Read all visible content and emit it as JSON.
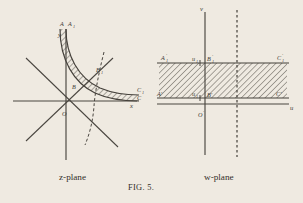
{
  "figure": {
    "number": "FIG. 5.",
    "caption_left": "z-plane",
    "caption_right": "w-plane",
    "background_color": "#efeae1",
    "ink_color": "#45413b"
  },
  "z_plane": {
    "name": "z-plane",
    "axis_x_label": "x",
    "axis_y_label": "y",
    "origin_label": "O",
    "points": {
      "A": "A",
      "A1": "A",
      "A1_sub": "1",
      "B": "B",
      "B1": "B",
      "B1_sub": "1",
      "C": "C",
      "C1": "C",
      "C1_sub": "1"
    },
    "features": [
      "x-axis",
      "y-axis",
      "asymptote-diagonal-positive",
      "asymptote-diagonal-negative",
      "hyperbola-branch-inner",
      "hyperbola-branch-outer",
      "hyperbola-branch-dashed",
      "hatched-region"
    ]
  },
  "w_plane": {
    "name": "w-plane",
    "axis_u_label": "u",
    "axis_v_label": "v",
    "origin_label": "O",
    "origin_prime": "′",
    "tick_u1_lower": "u",
    "tick_u1_lower_sub": "1",
    "tick_u1_upper": "u",
    "tick_u1_upper_sub": "1",
    "points": {
      "A_prime": "A′",
      "A1_prime": "A",
      "A1_prime_sub": "1",
      "A1_prime_mark": "′",
      "B_prime": "B′",
      "B1_prime": "B",
      "B1_prime_sub": "1",
      "B1_prime_mark": "′",
      "C_prime": "C′",
      "C1_prime": "C",
      "C1_prime_sub": "1",
      "C1_prime_mark": "′"
    },
    "features": [
      "u-axis",
      "v-axis",
      "hatched-strip",
      "strip-top-edge",
      "strip-bottom-edge",
      "dashed-vertical-line"
    ]
  }
}
